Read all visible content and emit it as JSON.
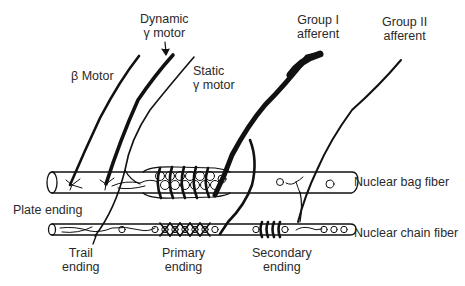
{
  "diagram": {
    "labels": {
      "dynamic_gamma": [
        "Dynamic",
        "γ motor"
      ],
      "beta_motor": "β Motor",
      "static_gamma": [
        "Static",
        "γ motor"
      ],
      "group1": [
        "Group I",
        "afferent"
      ],
      "group2": [
        "Group II",
        "afferent"
      ],
      "bag_fiber": "Nuclear bag fiber",
      "chain_fiber": "Nuclear chain fiber",
      "plate_ending": "Plate ending",
      "trail_ending": [
        "Trail",
        "ending"
      ],
      "primary_ending": [
        "Primary",
        "ending"
      ],
      "secondary_ending": [
        "Secondary",
        "ending"
      ]
    },
    "colors": {
      "ink": "#111111",
      "text": "#2a2a2a",
      "background": "#ffffff"
    }
  }
}
